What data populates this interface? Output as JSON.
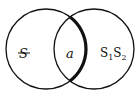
{
  "diagram": {
    "type": "venn",
    "stroke_color": "#111111",
    "background": "#ffffff",
    "left_circle": {
      "cx": 46,
      "cy": 49,
      "r": 40,
      "label": "S"
    },
    "right_circle": {
      "cx": 94,
      "cy": 49,
      "r": 40
    },
    "regions": {
      "left_only": {
        "label": "S",
        "struck": true
      },
      "intersection": {
        "label": "a"
      },
      "right_only": {
        "label_main": "S",
        "sub1": "1",
        "label_main2": "S",
        "sub2": "2"
      }
    },
    "highlighted_arc": "left circle right arc inside intersection (bold)"
  }
}
